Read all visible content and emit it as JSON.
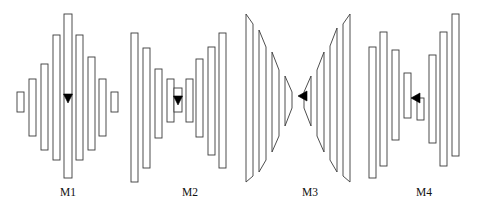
{
  "figure": {
    "type": "diagram",
    "background_color": "#ffffff",
    "stroke_color": "#3a3a3a",
    "fill_color": "#ffffff",
    "arrow_color": "#000000",
    "width": 480,
    "height": 210
  },
  "models": [
    {
      "id": "M1",
      "label": "M1",
      "label_x": 68,
      "label_y": 196,
      "shape": "diamond",
      "arrow": {
        "name": "down-arrow-m1",
        "direction": "down",
        "x": 68,
        "y": 99
      },
      "layers": [
        {
          "x": 17,
          "w": 7,
          "top": 92,
          "bottom": 112
        },
        {
          "x": 29,
          "w": 7,
          "top": 79,
          "bottom": 136
        },
        {
          "x": 41,
          "w": 7,
          "top": 64,
          "bottom": 150
        },
        {
          "x": 53,
          "w": 7,
          "top": 35,
          "bottom": 160
        },
        {
          "x": 64,
          "w": 8,
          "top": 14,
          "bottom": 178
        },
        {
          "x": 76,
          "w": 7,
          "top": 35,
          "bottom": 160
        },
        {
          "x": 88,
          "w": 7,
          "top": 57,
          "bottom": 150
        },
        {
          "x": 99,
          "w": 7,
          "top": 79,
          "bottom": 136
        },
        {
          "x": 111,
          "w": 7,
          "top": 92,
          "bottom": 112
        }
      ]
    },
    {
      "id": "M2",
      "label": "M2",
      "label_x": 190,
      "label_y": 196,
      "shape": "hourglass",
      "arrow": {
        "name": "down-arrow-m2",
        "direction": "down",
        "x": 178,
        "y": 101
      },
      "layers": [
        {
          "x": 131,
          "w": 7,
          "top": 33,
          "bottom": 182
        },
        {
          "x": 143,
          "w": 7,
          "top": 48,
          "bottom": 168
        },
        {
          "x": 155,
          "w": 7,
          "top": 69,
          "bottom": 138
        },
        {
          "x": 167,
          "w": 7,
          "top": 79,
          "bottom": 122
        },
        {
          "x": 174,
          "w": 8,
          "top": 88,
          "bottom": 112
        },
        {
          "x": 186,
          "w": 7,
          "top": 79,
          "bottom": 122
        },
        {
          "x": 196,
          "w": 7,
          "top": 59,
          "bottom": 137
        },
        {
          "x": 208,
          "w": 7,
          "top": 47,
          "bottom": 155
        },
        {
          "x": 219,
          "w": 7,
          "top": 33,
          "bottom": 168
        }
      ]
    },
    {
      "id": "M3",
      "label": "M3",
      "label_x": 310,
      "label_y": 196,
      "shape": "bowtie-trapezoid",
      "arrow": {
        "name": "left-arrow-m3",
        "direction": "left",
        "x": 302,
        "y": 96
      },
      "trapezoids": [
        {
          "x": 246,
          "w": 7,
          "outer_top": 14,
          "outer_bottom": 182,
          "inner_top": 24,
          "inner_bottom": 176
        },
        {
          "x": 259,
          "w": 7,
          "outer_top": 30,
          "outer_bottom": 172,
          "inner_top": 47,
          "inner_bottom": 160
        },
        {
          "x": 272,
          "w": 7,
          "outer_top": 52,
          "outer_bottom": 152,
          "inner_top": 70,
          "inner_bottom": 136
        },
        {
          "x": 285,
          "w": 7,
          "outer_top": 76,
          "outer_bottom": 126,
          "inner_top": 92,
          "inner_bottom": 108
        },
        {
          "x": 304,
          "w": 7,
          "outer_top": 92,
          "outer_bottom": 108,
          "inner_top": 76,
          "inner_bottom": 126
        },
        {
          "x": 317,
          "w": 7,
          "outer_top": 70,
          "outer_bottom": 136,
          "inner_top": 52,
          "inner_bottom": 152
        },
        {
          "x": 330,
          "w": 7,
          "outer_top": 46,
          "outer_bottom": 160,
          "inner_top": 28,
          "inner_bottom": 172
        },
        {
          "x": 343,
          "w": 7,
          "outer_top": 24,
          "outer_bottom": 176,
          "inner_top": 14,
          "inner_bottom": 182
        }
      ]
    },
    {
      "id": "M4",
      "label": "M4",
      "label_x": 424,
      "label_y": 196,
      "shape": "wide-bottleneck",
      "arrow": {
        "name": "left-arrow-m4",
        "direction": "left",
        "x": 415,
        "y": 98
      },
      "layers": [
        {
          "x": 369,
          "w": 7,
          "top": 47,
          "bottom": 178
        },
        {
          "x": 380,
          "w": 7,
          "top": 32,
          "bottom": 166
        },
        {
          "x": 392,
          "w": 7,
          "top": 50,
          "bottom": 140
        },
        {
          "x": 404,
          "w": 7,
          "top": 73,
          "bottom": 118
        },
        {
          "x": 417,
          "w": 7,
          "top": 98,
          "bottom": 120
        },
        {
          "x": 429,
          "w": 7,
          "top": 55,
          "bottom": 143
        },
        {
          "x": 440,
          "w": 7,
          "top": 32,
          "bottom": 166
        },
        {
          "x": 452,
          "w": 7,
          "top": 14,
          "bottom": 156
        }
      ]
    }
  ]
}
